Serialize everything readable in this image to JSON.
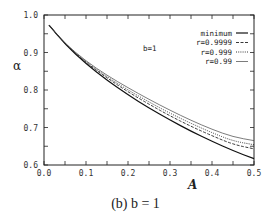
{
  "chart_data": {
    "type": "line",
    "title": "",
    "caption": "(b) b = 1",
    "annotation": "b=1",
    "xlabel": "A",
    "ylabel": "α",
    "xlim": [
      0.0,
      0.5
    ],
    "ylim": [
      0.6,
      1.0
    ],
    "xticks": [
      "0.0",
      "0.1",
      "0.2",
      "0.3",
      "0.4",
      "0.5"
    ],
    "yticks": [
      "0.6",
      "0.7",
      "0.8",
      "0.9",
      "1.0"
    ],
    "grid": false,
    "legend_position": "upper right",
    "x": [
      0.012,
      0.05,
      0.1,
      0.15,
      0.2,
      0.25,
      0.3,
      0.35,
      0.4,
      0.45,
      0.5
    ],
    "series": [
      {
        "name": "minimum",
        "style": "solid",
        "values": [
          0.973,
          0.922,
          0.87,
          0.826,
          0.787,
          0.752,
          0.72,
          0.69,
          0.663,
          0.638,
          0.617
        ]
      },
      {
        "name": "r=0.9999",
        "style": "dashed",
        "values": [
          0.973,
          0.923,
          0.873,
          0.832,
          0.795,
          0.762,
          0.731,
          0.703,
          0.678,
          0.655,
          0.643
        ]
      },
      {
        "name": "r=0.999",
        "style": "dotted",
        "values": [
          0.973,
          0.923,
          0.875,
          0.835,
          0.8,
          0.768,
          0.738,
          0.711,
          0.686,
          0.664,
          0.654
        ]
      },
      {
        "name": "r=0.99",
        "style": "thin-solid",
        "values": [
          0.973,
          0.924,
          0.877,
          0.839,
          0.806,
          0.775,
          0.746,
          0.719,
          0.695,
          0.675,
          0.665
        ]
      }
    ]
  }
}
